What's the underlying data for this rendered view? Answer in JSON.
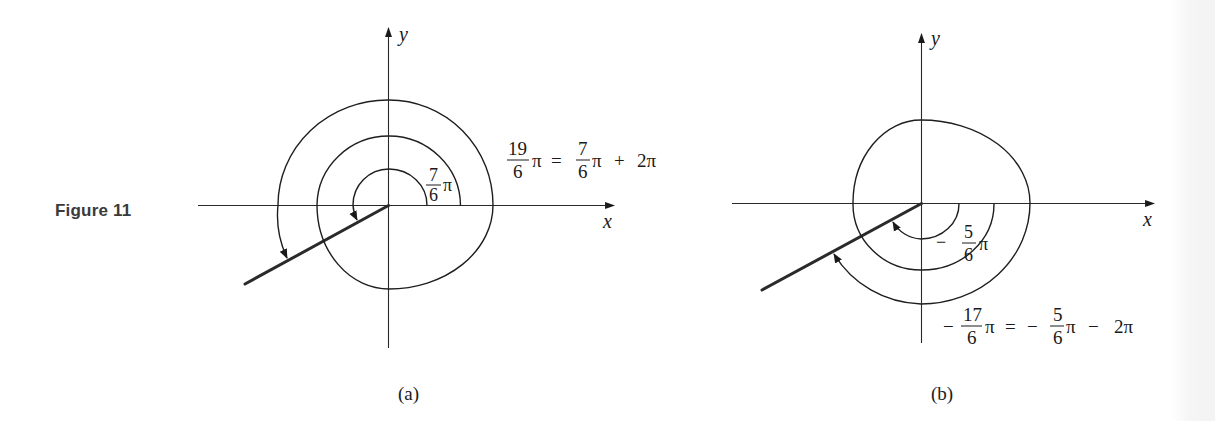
{
  "figure": {
    "label": "Figure 11"
  },
  "panel_a": {
    "caption": "(a)",
    "axis_x_label": "x",
    "axis_y_label": "y",
    "inner_angle": {
      "sign": "",
      "numerator": "7",
      "denominator": "6",
      "pi": "π",
      "value": "7/6 π"
    },
    "equation": {
      "lhs_numerator": "19",
      "lhs_denominator": "6",
      "lhs_pi": "π",
      "equals": "=",
      "rhs_numerator": "7",
      "rhs_denominator": "6",
      "rhs_pi": "π",
      "operator": "+",
      "rhs_term": "2π",
      "text": "19/6 π = 7/6 π + 2π"
    },
    "rotation": "counterclockwise"
  },
  "panel_b": {
    "caption": "(b)",
    "axis_x_label": "x",
    "axis_y_label": "y",
    "inner_angle": {
      "sign": "−",
      "numerator": "5",
      "denominator": "6",
      "pi": "π",
      "value": "−5/6 π"
    },
    "equation": {
      "lhs_sign": "−",
      "lhs_numerator": "17",
      "lhs_denominator": "6",
      "lhs_pi": "π",
      "equals": "=",
      "rhs_sign": "−",
      "rhs_numerator": "5",
      "rhs_denominator": "6",
      "rhs_pi": "π",
      "operator": "−",
      "rhs_term": "2π",
      "text": "−17/6 π = −5/6 π − 2π"
    },
    "rotation": "clockwise"
  },
  "colors": {
    "ink": "#1a1a1a",
    "figure_label": "#3a3a3a",
    "background": "#ffffff"
  }
}
